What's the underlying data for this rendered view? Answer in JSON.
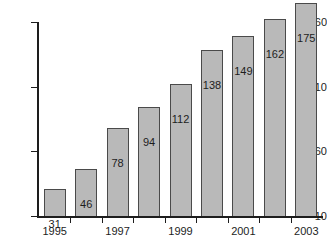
{
  "chart_data": {
    "type": "bar",
    "title": "",
    "subtitle": "",
    "xlabel": "",
    "ylabel": "",
    "categories": [
      "1995",
      "1996",
      "1997",
      "1998",
      "1999",
      "2000",
      "2001",
      "2002",
      "2003"
    ],
    "values": [
      31,
      46,
      78,
      94,
      112,
      138,
      149,
      162,
      175
    ],
    "value_labels": [
      "31",
      "46",
      "78",
      "94",
      "112",
      "138",
      "149",
      "162",
      "175"
    ],
    "x_tick_labels": [
      "1995",
      "1997",
      "1999",
      "2001",
      "2003"
    ],
    "x_tick_label_indices": [
      0,
      2,
      4,
      6,
      8
    ],
    "y_tick_labels": [
      "10",
      "60",
      "110",
      "160"
    ],
    "y_tick_values": [
      10,
      60,
      110,
      160
    ],
    "ylim": [
      10,
      185
    ],
    "grid": false,
    "legend": null,
    "legend_position": "none",
    "bar_color": "#b9b9b9",
    "bar_border_color": "#4a4a4a",
    "axis_color": "#1d1d1d",
    "background_color": "#ffffff"
  }
}
